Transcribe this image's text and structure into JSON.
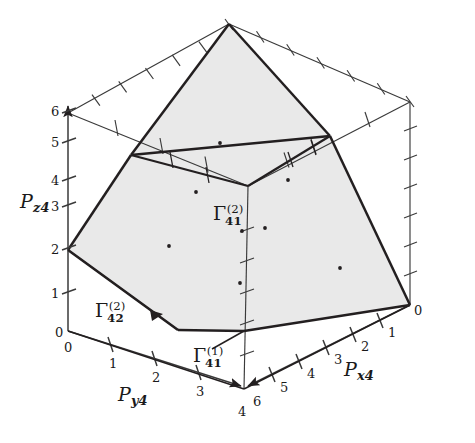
{
  "figure": {
    "kind": "3d-polyhedron-region-plot",
    "background_color": "#ffffff",
    "line_color": "#231f20",
    "fill_color": "#e9e9e9",
    "width": 475,
    "height": 443
  },
  "axes": {
    "z": {
      "name_base": "P",
      "name_sub": "z4",
      "label": "Pz4",
      "ticks": [
        "0",
        "1",
        "2",
        "3",
        "4",
        "5",
        "6"
      ],
      "origin_label": "0",
      "max_label": "6",
      "arrowhead": true,
      "direction": "up"
    },
    "y": {
      "name_base": "P",
      "name_sub": "y4",
      "label": "Py4",
      "ticks": [
        "0",
        "1",
        "2",
        "3",
        "4"
      ],
      "origin_label": "0",
      "max_label": "4",
      "arrowhead": true,
      "direction": "down-right"
    },
    "x": {
      "name_base": "P",
      "name_sub": "x4",
      "label": "Px4",
      "ticks": [
        "0",
        "1",
        "2",
        "3",
        "4",
        "5",
        "6"
      ],
      "origin_label": "0",
      "max_label": "6",
      "arrowhead": true,
      "direction": "down-left"
    }
  },
  "tick_labels": {
    "z_axis": [
      {
        "text": "0",
        "x": 58,
        "y": 333
      },
      {
        "text": "1",
        "x": 56,
        "y": 294
      },
      {
        "text": "2",
        "x": 56,
        "y": 250
      },
      {
        "text": "3",
        "x": 56,
        "y": 206
      },
      {
        "text": "4",
        "x": 56,
        "y": 178
      },
      {
        "text": "5",
        "x": 56,
        "y": 140
      },
      {
        "text": "6",
        "x": 56,
        "y": 105
      }
    ],
    "y_axis": [
      {
        "text": "0",
        "x": 65,
        "y": 340
      },
      {
        "text": "1",
        "x": 108,
        "y": 355
      },
      {
        "text": "2",
        "x": 151,
        "y": 375
      },
      {
        "text": "3",
        "x": 196,
        "y": 394
      },
      {
        "text": "4",
        "x": 240,
        "y": 413
      }
    ],
    "x_axis": [
      {
        "text": "0",
        "x": 413,
        "y": 309
      },
      {
        "text": "1",
        "x": 390,
        "y": 333
      },
      {
        "text": "2",
        "x": 356,
        "y": 347
      },
      {
        "text": "3",
        "x": 330,
        "y": 362
      },
      {
        "text": "4",
        "x": 308,
        "y": 377
      },
      {
        "text": "5",
        "x": 283,
        "y": 392
      },
      {
        "text": "6",
        "x": 256,
        "y": 404
      }
    ]
  },
  "region_labels": [
    {
      "id": "gamma-41-2",
      "base": "Γ",
      "superscript": "(2)",
      "subscript": "41",
      "x": 228,
      "y": 215
    },
    {
      "id": "gamma-42-2",
      "base": "Γ",
      "superscript": "(2)",
      "subscript": "42",
      "x": 100,
      "y": 313
    },
    {
      "id": "gamma-41-1",
      "base": "Γ",
      "superscript": "(1)",
      "subscript": "41",
      "x": 200,
      "y": 357
    }
  ],
  "axis_name_labels": [
    {
      "id": "pz4",
      "base": "P",
      "sub": "z4",
      "x": 19,
      "y": 195
    },
    {
      "id": "py4",
      "base": "P",
      "sub": "y4",
      "x": 118,
      "y": 391
    },
    {
      "id": "px4",
      "base": "P",
      "sub": "x4",
      "x": 345,
      "y": 370
    }
  ],
  "geometry": {
    "box_vertices": {
      "origin_bottom_left": [
        68,
        331
      ],
      "z_top_left": [
        68,
        113
      ],
      "y_end_bottom": [
        244,
        389
      ],
      "x_end_right": [
        410,
        305
      ],
      "top_apex": [
        229,
        24
      ],
      "right_top": [
        410,
        102
      ],
      "left_far": [
        68,
        113
      ],
      "inner_back": [
        248,
        186
      ]
    },
    "shaded_polygon": [
      [
        68,
        250
      ],
      [
        131,
        155
      ],
      [
        229,
        24
      ],
      [
        330,
        136
      ],
      [
        410,
        305
      ],
      [
        244,
        331
      ],
      [
        178,
        330
      ]
    ],
    "interior_dots": [
      [
        196,
        192
      ],
      [
        169,
        246
      ],
      [
        242,
        231
      ],
      [
        240,
        283
      ],
      [
        265,
        228
      ],
      [
        288,
        180
      ],
      [
        340,
        268
      ],
      [
        220,
        137
      ]
    ]
  }
}
